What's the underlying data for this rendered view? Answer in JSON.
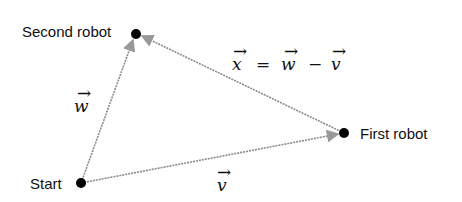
{
  "diagram": {
    "nodes": [
      {
        "id": "start",
        "label": "Start",
        "x": 81,
        "y": 183
      },
      {
        "id": "second",
        "label": "Second robot",
        "x": 136,
        "y": 34
      },
      {
        "id": "first",
        "label": "First robot",
        "x": 344,
        "y": 133
      }
    ],
    "edges": [
      {
        "from": "start",
        "to": "second",
        "label": "w"
      },
      {
        "from": "start",
        "to": "first",
        "label": "v"
      },
      {
        "from": "first",
        "to": "second",
        "label": "x = w − v"
      }
    ],
    "equation": {
      "x": "x",
      "eq": "=",
      "w": "w",
      "minus": "−",
      "v": "v"
    },
    "colors": {
      "line": "#8a8a8a",
      "dot": "#000000"
    }
  }
}
